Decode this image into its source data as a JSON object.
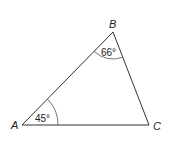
{
  "figure": {
    "type": "triangle",
    "vertices": [
      {
        "name": "A",
        "angle_label": "45°"
      },
      {
        "name": "B",
        "angle_label": "66°"
      },
      {
        "name": "C",
        "angle_label": ""
      }
    ]
  }
}
